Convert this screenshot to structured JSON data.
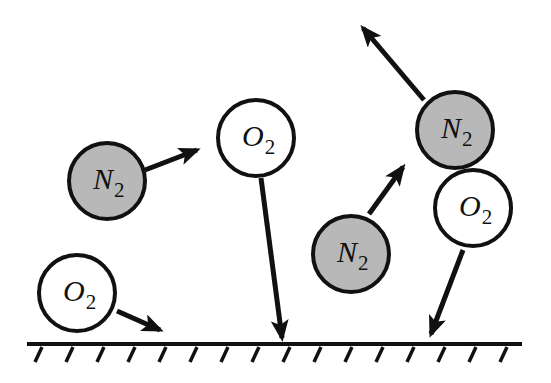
{
  "diagram": {
    "title": "",
    "colors": {
      "nitrogen_fill": "#b8b8b8",
      "oxygen_fill": "#ffffff",
      "stroke": "#111111"
    },
    "molecules": [
      {
        "id": "n2-left",
        "element": "N",
        "subscript": "2",
        "type": "nitrogen",
        "cx": 107,
        "cy": 181,
        "r": 38,
        "arrow": {
          "x1": 145,
          "y1": 170,
          "x2": 197,
          "y2": 150
        }
      },
      {
        "id": "o2-top-middle",
        "element": "O",
        "subscript": "2",
        "type": "oxygen",
        "cx": 256,
        "cy": 138,
        "r": 38,
        "arrow": {
          "x1": 261,
          "y1": 178,
          "x2": 282,
          "y2": 338
        }
      },
      {
        "id": "n2-top-right",
        "element": "N",
        "subscript": "2",
        "type": "nitrogen",
        "cx": 455,
        "cy": 130,
        "r": 38,
        "arrow": {
          "x1": 424,
          "y1": 100,
          "x2": 363,
          "y2": 28
        }
      },
      {
        "id": "n2-bottom-middle",
        "element": "N",
        "subscript": "2",
        "type": "nitrogen",
        "cx": 351,
        "cy": 254,
        "r": 38,
        "arrow": {
          "x1": 369,
          "y1": 214,
          "x2": 403,
          "y2": 167
        }
      },
      {
        "id": "o2-right",
        "element": "O",
        "subscript": "2",
        "type": "oxygen",
        "cx": 473,
        "cy": 208,
        "r": 38,
        "arrow": {
          "x1": 463,
          "y1": 250,
          "x2": 431,
          "y2": 334
        }
      },
      {
        "id": "o2-bottom-left",
        "element": "O",
        "subscript": "2",
        "type": "oxygen",
        "cx": 77,
        "cy": 293,
        "r": 38,
        "arrow": {
          "x1": 117,
          "y1": 311,
          "x2": 160,
          "y2": 330
        }
      }
    ],
    "surface": {
      "label": "surface",
      "x1": 27,
      "x2": 522,
      "y": 344,
      "hatch_count": 16,
      "hatch_spacing": 31,
      "hatch_start": 42
    }
  }
}
